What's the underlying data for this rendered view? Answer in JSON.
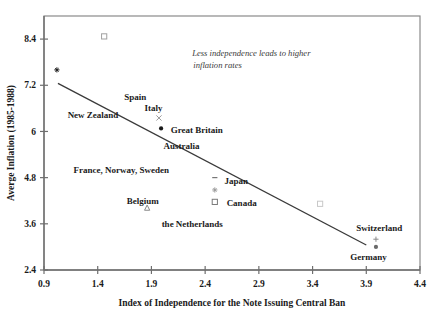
{
  "chart_data": {
    "type": "scatter",
    "title": "",
    "xlabel": "Index of Independence for the Note Issuing Central Ban",
    "ylabel": "Averge Inflation (1985-1988)",
    "xlim": [
      0.9,
      4.4
    ],
    "ylim": [
      2.4,
      9.0
    ],
    "xticks": [
      "0.9",
      "1.4",
      "1.9",
      "2.4",
      "2.9",
      "3.4",
      "3.9",
      "4.4"
    ],
    "xtick_values": [
      0.9,
      1.4,
      1.9,
      2.4,
      2.9,
      3.4,
      3.9,
      4.4
    ],
    "yticks": [
      "2.4",
      "3.6",
      "4.8",
      "6",
      "7.2",
      "8.4"
    ],
    "ytick_values": [
      2.4,
      3.6,
      4.8,
      6.0,
      7.2,
      8.4
    ],
    "grid": false,
    "legend": "none",
    "annotations": [
      {
        "name": "trend-annotation",
        "line1": "Less independence leads to higher",
        "line2": "inflation rates",
        "x": 2.83,
        "y": 7.95
      }
    ],
    "trendline": {
      "name": "regression-line",
      "x0": 1.03,
      "y0": 7.25,
      "x1": 3.9,
      "y1": 3.05,
      "color": "#3a3a3a"
    },
    "points": [
      {
        "label": "New Zealand",
        "x": 1.02,
        "y": 7.6,
        "marker": "asterisk",
        "color": "#1a1a1a",
        "label_x": 1.12,
        "label_y": 6.42,
        "anchor": "start"
      },
      {
        "label": "Spain",
        "x": 1.46,
        "y": 8.47,
        "marker": "square-open",
        "color": "#a0a0a0",
        "label_x": 1.75,
        "label_y": 6.9,
        "anchor": "middle"
      },
      {
        "label": "Italy",
        "x": 1.97,
        "y": 6.35,
        "marker": "x",
        "color": "#9a9a9a",
        "label_x": 1.92,
        "label_y": 6.62,
        "anchor": "middle"
      },
      {
        "label": "Great Britain",
        "x": 1.99,
        "y": 6.08,
        "marker": "circle-filled",
        "color": "#1a1a1a",
        "label_x": 2.08,
        "label_y": 6.05,
        "anchor": "start"
      },
      {
        "label": "Australia",
        "x": 2.2,
        "y": 5.65,
        "marker": "none",
        "color": "#1a1a1a",
        "label_x": 2.18,
        "label_y": 5.62,
        "anchor": "middle"
      },
      {
        "label": "France, Norway, Sweden",
        "x": 1.62,
        "y": 5.0,
        "marker": "none",
        "color": "#1a1a1a",
        "label_x": 1.62,
        "label_y": 5.0,
        "anchor": "middle"
      },
      {
        "label": "Japan",
        "x": 2.49,
        "y": 4.8,
        "marker": "dash",
        "color": "#6a6a6a",
        "label_x": 2.58,
        "label_y": 4.72,
        "anchor": "start"
      },
      {
        "label": "",
        "x": 2.49,
        "y": 4.48,
        "marker": "asterisk",
        "color": "#9a9a9a",
        "label_x": 0,
        "label_y": 0,
        "anchor": "middle"
      },
      {
        "label": "Canada",
        "x": 2.49,
        "y": 4.17,
        "marker": "square-open",
        "color": "#7a7a7a",
        "label_x": 2.6,
        "label_y": 4.15,
        "anchor": "start"
      },
      {
        "label": "Belgium",
        "x": 1.86,
        "y": 4.02,
        "marker": "triangle-open",
        "color": "#8a8a8a",
        "label_x": 1.82,
        "label_y": 4.2,
        "anchor": "middle"
      },
      {
        "label": "the Netherlands",
        "x": 2.28,
        "y": 3.6,
        "marker": "none",
        "color": "#1a1a1a",
        "label_x": 2.28,
        "label_y": 3.6,
        "anchor": "middle"
      },
      {
        "label": "",
        "x": 3.47,
        "y": 4.12,
        "marker": "square-open",
        "color": "#c8c8c8",
        "label_x": 0,
        "label_y": 0,
        "anchor": "middle"
      },
      {
        "label": "Switzerland",
        "x": 3.99,
        "y": 3.2,
        "marker": "plus",
        "color": "#8a8a8a",
        "label_x": 4.02,
        "label_y": 3.5,
        "anchor": "middle"
      },
      {
        "label": "Germany",
        "x": 3.99,
        "y": 3.0,
        "marker": "circle-filled",
        "color": "#6a6a6a",
        "label_x": 3.92,
        "label_y": 2.73,
        "anchor": "middle"
      }
    ]
  },
  "axes": {
    "x_title": "Index of Independence for the Note Issuing Central Ban",
    "y_title": "Averge Inflation (1985-1988)"
  }
}
